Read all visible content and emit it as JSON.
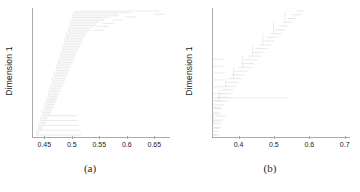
{
  "figure": {
    "panels": [
      {
        "caption": "(a)",
        "ylabel": "Dimension 1",
        "ticks": [
          "0.45",
          "0.5",
          "0.55",
          "0.6",
          "0.65"
        ],
        "tick_values": [
          0.45,
          0.5,
          0.55,
          0.6,
          0.65
        ],
        "line_color": "#d9d9d9",
        "axis_color": "#aaaaaa"
      },
      {
        "caption": "(b)",
        "ylabel": "Dimension 1",
        "ticks": [
          "0.4",
          "0.5",
          "0.6",
          "0.7"
        ],
        "tick_values": [
          0.4,
          0.5,
          0.6,
          0.7
        ],
        "line_color": "#d9d9d9",
        "axis_color": "#aaaaaa"
      }
    ]
  },
  "chart_data": [
    {
      "type": "line",
      "subtype": "dendrogram",
      "title": "",
      "caption": "(a)",
      "xlabel": "",
      "ylabel": "Dimension 1",
      "xlim": [
        0.425,
        0.685
      ],
      "ylim": [
        0,
        1
      ],
      "grid": false,
      "legend": null,
      "xticks": [
        0.45,
        0.5,
        0.55,
        0.6,
        0.65
      ],
      "xticklabels": [
        "0.45",
        "0.5",
        "0.55",
        "0.6",
        "0.65"
      ],
      "yticks": [],
      "yticklabels": [],
      "orientation": "horizontal",
      "description": "Horizontal hierarchical clustering dendrogram; dense fan of leaf merges concentrated between 0.44 and 0.52, tapering to a few high-level merges near 0.55-0.67.",
      "merge_heights": [
        0.437,
        0.441,
        0.444,
        0.446,
        0.449,
        0.452,
        0.454,
        0.456,
        0.459,
        0.461,
        0.463,
        0.466,
        0.468,
        0.47,
        0.472,
        0.474,
        0.476,
        0.478,
        0.48,
        0.482,
        0.484,
        0.486,
        0.488,
        0.49,
        0.492,
        0.494,
        0.496,
        0.498,
        0.5,
        0.502,
        0.504,
        0.506,
        0.508,
        0.51,
        0.512,
        0.514,
        0.516,
        0.518,
        0.521,
        0.524,
        0.527,
        0.531,
        0.535,
        0.54,
        0.546,
        0.553,
        0.561,
        0.572,
        0.588,
        0.612,
        0.668
      ]
    },
    {
      "type": "line",
      "subtype": "dendrogram",
      "title": "",
      "caption": "(b)",
      "xlabel": "",
      "ylabel": "Dimension 1",
      "xlim": [
        0.325,
        0.715
      ],
      "ylim": [
        0,
        1
      ],
      "grid": false,
      "legend": null,
      "xticks": [
        0.4,
        0.5,
        0.6,
        0.7
      ],
      "xticklabels": [
        "0.4",
        "0.5",
        "0.6",
        "0.7"
      ],
      "yticks": [],
      "yticklabels": [],
      "orientation": "horizontal",
      "description": "Horizontal hierarchical clustering dendrogram with a staircase cascade of merges rising from about 0.33 at the bottom to roughly 0.58 at the top, plus one long horizontal link reaching 0.54 in the lower third.",
      "merge_heights": [
        0.333,
        0.337,
        0.341,
        0.346,
        0.352,
        0.358,
        0.341,
        0.349,
        0.356,
        0.362,
        0.368,
        0.374,
        0.38,
        0.387,
        0.395,
        0.403,
        0.411,
        0.42,
        0.429,
        0.438,
        0.447,
        0.457,
        0.466,
        0.476,
        0.486,
        0.496,
        0.506,
        0.516,
        0.527,
        0.537,
        0.548,
        0.559,
        0.57,
        0.578,
        0.54
      ]
    }
  ]
}
